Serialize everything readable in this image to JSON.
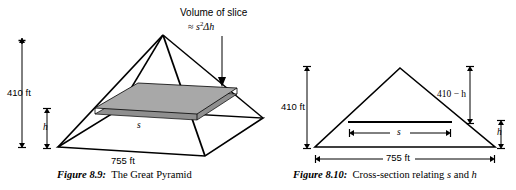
{
  "figure_left": {
    "id": "figure-8-9",
    "caption_label": "Figure 8.9:",
    "caption_text": "The Great Pyramid",
    "annotation_line1": "Volume of slice",
    "annotation_line2_approx": "≈",
    "annotation_line2_base": "s",
    "annotation_line2_exp": "2",
    "annotation_line2_delta": "Δh",
    "height_label": "410 ft",
    "slice_height_label": "h",
    "base_label": "755 ft",
    "slice_side_label": "s"
  },
  "figure_right": {
    "id": "figure-8-10",
    "caption_label": "Figure 8.10:",
    "caption_text_pre": "Cross-section relating",
    "caption_s": "s",
    "caption_and": "and",
    "caption_h": "h",
    "height_label": "410 ft",
    "upper_height_label": "410 − h",
    "slice_height_label": "h",
    "base_label": "755 ft",
    "slice_side_label": "s"
  },
  "colors": {
    "ink": "#000000",
    "slice_fill": "#a8a8a8",
    "slice_edge_fill": "#8f8f8f",
    "background": "#ffffff"
  }
}
